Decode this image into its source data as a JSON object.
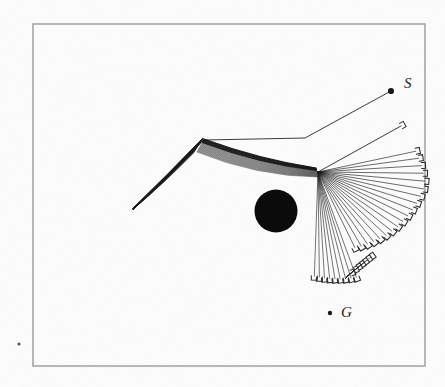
{
  "figure": {
    "background_color": "#fdfdfd",
    "ink_color": "#1a1a1a",
    "frame": {
      "name": "figure-border",
      "x": 33,
      "y": 24,
      "width": 392,
      "height": 342,
      "stroke": "#9a9a9a",
      "stroke_width": 1.4
    },
    "labels": [
      {
        "id": "start",
        "text": "S",
        "text_x": 404,
        "text_y": 88,
        "dot_x": 391,
        "dot_y": 91,
        "dot_r": 3.1
      },
      {
        "id": "goal",
        "text": "G",
        "text_x": 341,
        "text_y": 317,
        "dot_x": 330,
        "dot_y": 313,
        "dot_r": 2.2
      }
    ],
    "obstacle": {
      "id": "circular-obstacle",
      "cx": 276,
      "cy": 211,
      "r": 21.5,
      "fill": "#0b0b0b"
    },
    "stray_dot": {
      "id": "stray-speck",
      "cx": 19,
      "cy": 344,
      "r": 1.6
    },
    "nodes": {
      "root_vertex": {
        "x": 205,
        "y": 140
      },
      "fan_hub": {
        "x": 318,
        "y": 172
      },
      "left_tip": {
        "x": 133,
        "y": 209
      },
      "lower_convergence": {
        "x": 345,
        "y": 275
      },
      "start_elbow": {
        "x": 305,
        "y": 138
      },
      "c_marker_end": {
        "x": 401,
        "y": 126
      }
    },
    "trunk_paths": [
      {
        "id": "start-link-upper",
        "points": "205,140 305,138 391,91"
      },
      {
        "id": "hub-to-c-marker",
        "points": "318,172 401,126"
      }
    ],
    "upper_bundle": {
      "id": "upper-wedge-bundle",
      "description": "dense bundle of near-parallel edges from root vertex to left tip",
      "count": 26
    },
    "right_bundle": {
      "id": "right-wedge-bundle",
      "description": "dense bundle of edges from root vertex to fan hub",
      "count": 24
    },
    "fan": {
      "id": "trajectory-fan",
      "description": "radial fan of trajectory branches from hub with hook end-markers",
      "count": 19,
      "hub_x": 318,
      "hub_y": 172,
      "angle_start_deg": -12,
      "angle_end_deg": 64,
      "radius_min": 74,
      "radius_max": 108
    },
    "lower_fan": {
      "id": "lower-convergent-fan",
      "description": "short branches converging near the lower tip",
      "count": 9
    },
    "end_marker": {
      "id": "hook-marker",
      "description": "small c-shaped hook glyph at each branch terminus",
      "size": 6
    }
  }
}
